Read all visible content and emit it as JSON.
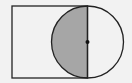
{
  "diagram": {
    "type": "geometry",
    "background": "#f2f2f2",
    "stroke_color": "#222222",
    "shade_color": "#a6a6a6",
    "rectangle": {
      "x": 12,
      "y": 6,
      "width": 75.5,
      "height": 72
    },
    "circle": {
      "cx": 87.5,
      "cy": 42,
      "r": 36
    },
    "center_point": {
      "x": 87.5,
      "y": 42
    },
    "shaded_region": "left semicircle"
  }
}
